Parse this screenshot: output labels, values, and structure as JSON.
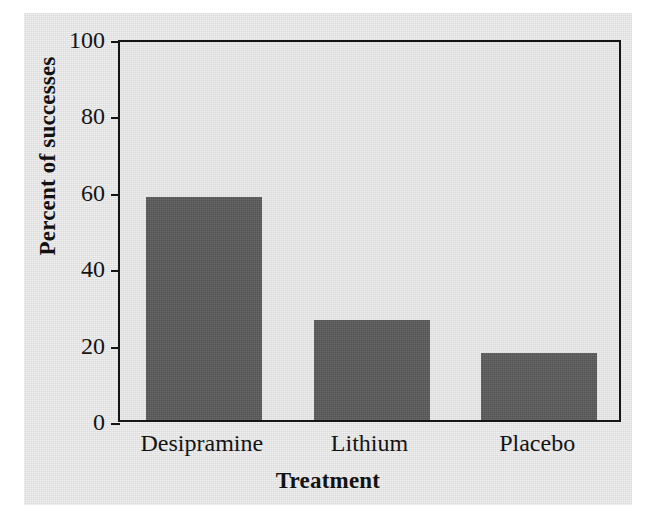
{
  "chart_data": {
    "type": "bar",
    "title": "",
    "subtitle": "",
    "xlabel": "Treatment",
    "ylabel": "Percent of successes",
    "categories": [
      "Desipramine",
      "Lithium",
      "Placebo"
    ],
    "values": [
      58.4,
      26.3,
      17.6
    ],
    "ylim": [
      0,
      100
    ],
    "yticks": [
      0,
      20,
      40,
      60,
      80,
      100
    ],
    "ytick_labels": [
      "0",
      "20",
      "40",
      "60",
      "80",
      "100"
    ],
    "grid": false,
    "legend": null,
    "legend_position": "none",
    "annotations": [],
    "colors": {
      "bar_fill": "#5b5b5b",
      "axis_line": "#151515",
      "plot_background": "#e0e0e0",
      "figure_background": "#e3e3e3",
      "page_background": "#ffffff",
      "text": "#141414"
    }
  },
  "axes": {
    "y": {
      "title": "Percent of successes",
      "ticks": [
        {
          "label": "100",
          "value": 100
        },
        {
          "label": "80",
          "value": 80
        },
        {
          "label": "60",
          "value": 60
        },
        {
          "label": "40",
          "value": 40
        },
        {
          "label": "20",
          "value": 20
        },
        {
          "label": "0",
          "value": 0
        }
      ]
    },
    "x": {
      "title": "Treatment",
      "ticks": [
        {
          "label": "Desipramine"
        },
        {
          "label": "Lithium"
        },
        {
          "label": "Placebo"
        }
      ]
    }
  },
  "bars": [
    {
      "category": "Desipramine",
      "value": 58.4
    },
    {
      "category": "Lithium",
      "value": 26.3
    },
    {
      "category": "Placebo",
      "value": 17.6
    }
  ]
}
